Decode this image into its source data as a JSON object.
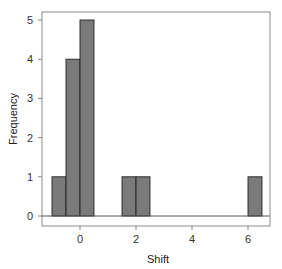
{
  "chart_data": {
    "type": "bar",
    "subtype": "histogram",
    "title": "",
    "xlabel": "Shift",
    "ylabel": "Frequency",
    "xlim": [
      -1.3,
      6.9
    ],
    "ylim": [
      -0.25,
      5.2
    ],
    "xticks": [
      0,
      2,
      4,
      6
    ],
    "yticks": [
      0,
      1,
      2,
      3,
      4,
      5
    ],
    "bin_width": 0.5,
    "bins": [
      {
        "start": -1.0,
        "end": -0.5,
        "count": 1
      },
      {
        "start": -0.5,
        "end": 0.0,
        "count": 4
      },
      {
        "start": 0.0,
        "end": 0.5,
        "count": 5
      },
      {
        "start": 1.5,
        "end": 2.0,
        "count": 1
      },
      {
        "start": 2.0,
        "end": 2.5,
        "count": 1
      },
      {
        "start": 6.0,
        "end": 6.5,
        "count": 1
      }
    ],
    "categories": [
      "-1.0–-0.5",
      "-0.5–0.0",
      "0.0–0.5",
      "1.5–2.0",
      "2.0–2.5",
      "6.0–6.5"
    ],
    "values": [
      1,
      4,
      5,
      1,
      1,
      1
    ],
    "grid": false,
    "legend": null,
    "colors": {
      "bar_fill": "#7a7a7a",
      "bar_edge": "#222222",
      "axis": "#888888",
      "baseline": "#555555"
    }
  }
}
